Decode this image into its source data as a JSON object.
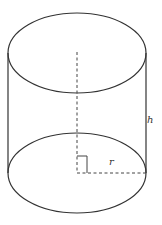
{
  "figure": {
    "type": "cylinder",
    "labels": {
      "height": "h",
      "radius": "r"
    },
    "colors": {
      "stroke": "#333333",
      "background": "#ffffff"
    }
  }
}
